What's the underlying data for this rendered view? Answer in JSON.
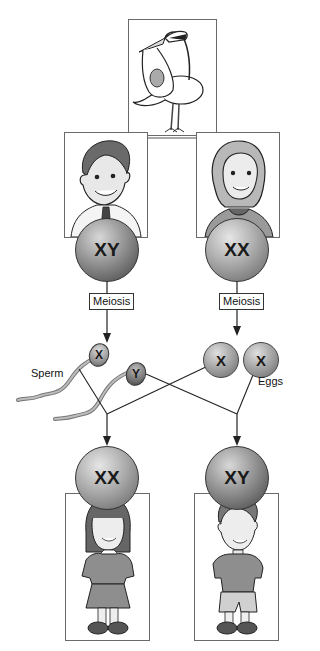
{
  "diagram": {
    "stork": {
      "icon": "stork-delivering-baby-icon"
    },
    "parents": {
      "father": {
        "icon": "father-portrait-icon",
        "cell_label": "XY"
      },
      "mother": {
        "icon": "mother-portrait-icon",
        "cell_label": "XX"
      }
    },
    "process": {
      "father_step": "Meiosis",
      "mother_step": "Meiosis"
    },
    "gametes": {
      "sperm_label": "Sperm",
      "eggs_label": "Eggs",
      "sperm": [
        {
          "chromosome": "X"
        },
        {
          "chromosome": "Y"
        }
      ],
      "eggs": [
        {
          "chromosome": "X"
        },
        {
          "chromosome": "X"
        }
      ]
    },
    "offspring": {
      "daughter": {
        "icon": "girl-child-icon",
        "cell_label": "XX"
      },
      "son": {
        "icon": "boy-child-icon",
        "cell_label": "XY"
      }
    },
    "colors": {
      "line": "#333333",
      "cell_dark": "#5e5e5e",
      "cell_light": "#9a9a9a",
      "frame": "#6a6a6a"
    }
  }
}
